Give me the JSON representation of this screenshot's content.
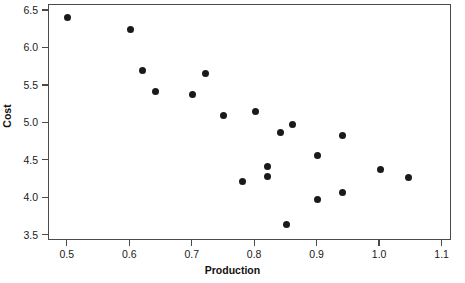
{
  "chart_data": {
    "type": "scatter",
    "title": "",
    "xlabel": "Production",
    "ylabel": "Cost",
    "xlim": [
      0.47,
      1.115
    ],
    "ylim": [
      3.43,
      6.58
    ],
    "xticks": [
      "0.5",
      "0.6",
      "0.7",
      "0.8",
      "0.9",
      "1.0",
      "1.1"
    ],
    "xtick_values": [
      0.5,
      0.6,
      0.7,
      0.8,
      0.9,
      1.0,
      1.1
    ],
    "yticks": [
      "3.5",
      "4.0",
      "4.5",
      "5.0",
      "5.5",
      "6.0",
      "6.5"
    ],
    "ytick_values": [
      3.5,
      4.0,
      4.5,
      5.0,
      5.5,
      6.0,
      6.5
    ],
    "grid": false,
    "legend": false,
    "marker": "filled-circle",
    "marker_color": "#1a1a1a",
    "frame_color": "#4a4a4a",
    "background": "#ffffff",
    "n_points": 21,
    "points": [
      {
        "x": 0.5,
        "y": 6.41
      },
      {
        "x": 0.6,
        "y": 6.25
      },
      {
        "x": 0.62,
        "y": 5.71
      },
      {
        "x": 0.64,
        "y": 5.43
      },
      {
        "x": 0.7,
        "y": 5.39
      },
      {
        "x": 0.72,
        "y": 5.67
      },
      {
        "x": 0.75,
        "y": 5.11
      },
      {
        "x": 0.78,
        "y": 4.23
      },
      {
        "x": 0.8,
        "y": 5.16
      },
      {
        "x": 0.82,
        "y": 4.42
      },
      {
        "x": 0.82,
        "y": 4.29
      },
      {
        "x": 0.84,
        "y": 4.88
      },
      {
        "x": 0.85,
        "y": 3.65
      },
      {
        "x": 0.86,
        "y": 4.99
      },
      {
        "x": 0.9,
        "y": 4.57
      },
      {
        "x": 0.9,
        "y": 3.99
      },
      {
        "x": 0.94,
        "y": 4.84
      },
      {
        "x": 0.94,
        "y": 4.08
      },
      {
        "x": 1.0,
        "y": 4.39
      },
      {
        "x": 1.045,
        "y": 4.28
      }
    ]
  }
}
